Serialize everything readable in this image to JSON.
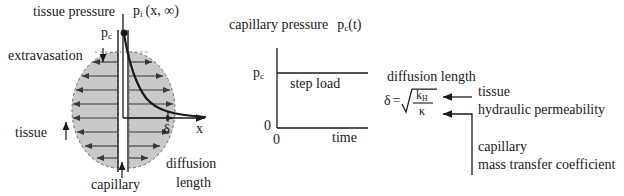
{
  "figure": {
    "ink_color": "#1a1a1a",
    "fill_color": "#c9c9c9"
  },
  "panel_pressure": {
    "tissue_pressure_label": "tissue pressure",
    "pi_label_base": "p",
    "pi_label_sub": "i",
    "pi_label_args": "(x, ∞)",
    "pc_label_base": "p",
    "pc_label_sub": "c",
    "extravasation_label": "extravasation",
    "tissue_label": "tissue",
    "capillary_label": "capillary",
    "delta_label": "δ",
    "x_axis_label": "x",
    "diffusion_label_line1": "diffusion",
    "diffusion_label_line2": "length"
  },
  "panel_step": {
    "title_text": "capillary pressure",
    "title_sym_base": "p",
    "title_sym_sub": "c",
    "title_sym_arg": "(t)",
    "y_value_label_base": "p",
    "y_value_label_sub": "c",
    "y_zero_label": "0",
    "x_zero_label": "0",
    "x_axis_label": "time",
    "curve_label": "step load"
  },
  "panel_formula": {
    "heading": "diffusion  length",
    "delta_symbol": "δ",
    "equals": "=",
    "numerator_base": "k",
    "numerator_sub": "H",
    "denominator": "κ",
    "annotation_1_line1": "tissue",
    "annotation_1_line2": "hydraulic  permeability",
    "annotation_2_line1": "capillary",
    "annotation_2_line2": "mass transfer coefficient"
  }
}
